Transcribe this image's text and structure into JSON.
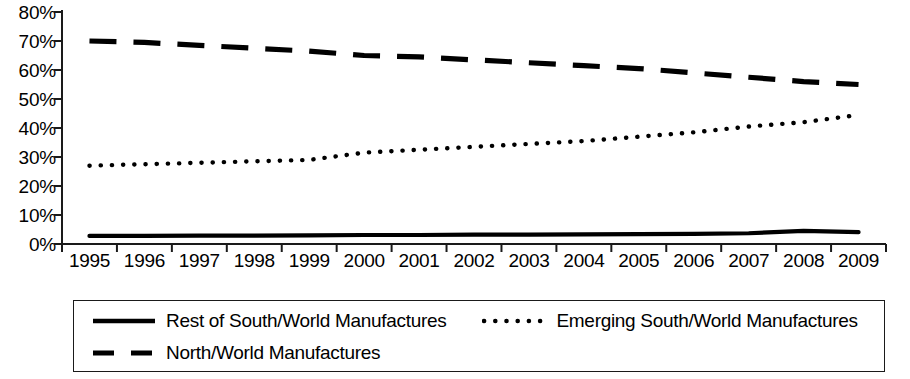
{
  "chart_data": {
    "type": "line",
    "title": "",
    "subtitle": "",
    "xlabel": "",
    "ylabel": "",
    "categories": [
      "1995",
      "1996",
      "1997",
      "1998",
      "1999",
      "2000",
      "2001",
      "2002",
      "2003",
      "2004",
      "2005",
      "2006",
      "2007",
      "2008",
      "2009"
    ],
    "x_tick_labels": [
      "1995",
      "1996",
      "1997",
      "1998",
      "1999",
      "2000",
      "2001",
      "2002",
      "2003",
      "2004",
      "2005",
      "2006",
      "2007",
      "2008",
      "2009"
    ],
    "y_tick_labels": [
      "80%",
      "70%",
      "60%",
      "50%",
      "40%",
      "30%",
      "20%",
      "10%",
      "0%"
    ],
    "y_tick_values": [
      80,
      70,
      60,
      50,
      40,
      30,
      20,
      10,
      0
    ],
    "ylim": [
      0,
      80
    ],
    "y_unit": "%",
    "grid": false,
    "legend_position": "bottom",
    "series": [
      {
        "name": "Rest of South/World Manufactures",
        "line_style": "solid",
        "color": "#000000",
        "values": [
          2.8,
          2.8,
          2.9,
          2.9,
          3.0,
          3.1,
          3.1,
          3.2,
          3.2,
          3.3,
          3.4,
          3.5,
          3.7,
          4.5,
          4.1
        ]
      },
      {
        "name": "Emerging South/World Manufactures",
        "line_style": "dotted",
        "color": "#000000",
        "values": [
          27.0,
          27.5,
          28.0,
          28.5,
          29.0,
          31.5,
          32.5,
          33.5,
          34.5,
          35.5,
          37.0,
          38.5,
          40.5,
          42.0,
          44.5
        ]
      },
      {
        "name": "North/World Manufactures",
        "line_style": "dashed",
        "color": "#000000",
        "values": [
          70.0,
          69.5,
          68.5,
          67.5,
          66.5,
          65.0,
          64.5,
          63.5,
          62.5,
          61.5,
          60.5,
          59.0,
          57.5,
          56.0,
          55.0
        ]
      }
    ]
  },
  "legend": {
    "entries": [
      {
        "label": "Rest of South/World Manufactures",
        "style": "solid"
      },
      {
        "label": "Emerging South/World Manufactures",
        "style": "dotted"
      },
      {
        "label": "North/World Manufactures",
        "style": "dashed"
      }
    ]
  }
}
